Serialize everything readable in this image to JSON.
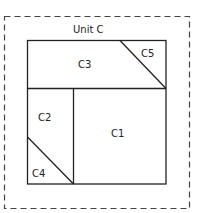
{
  "diagram": {
    "unit_label": "Unit C",
    "regions": [
      {
        "id": "C1",
        "label": "C1"
      },
      {
        "id": "C2",
        "label": "C2"
      },
      {
        "id": "C3",
        "label": "C3"
      },
      {
        "id": "C4",
        "label": "C4"
      },
      {
        "id": "C5",
        "label": "C5"
      }
    ],
    "colors": {
      "stroke": "#222222",
      "dashed_border": "#444444",
      "background": "#ffffff"
    }
  }
}
